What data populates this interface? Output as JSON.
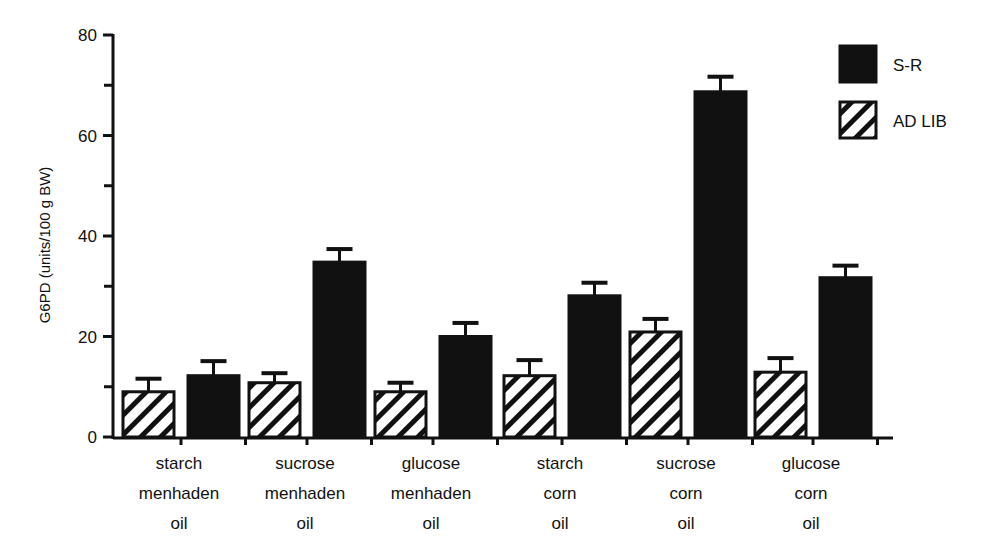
{
  "chart_data": {
    "type": "bar",
    "title": "",
    "xlabel": "",
    "ylabel": "G6PD (units/100 g BW)",
    "ylim": [
      0,
      80
    ],
    "yticks_major": [
      0,
      20,
      40,
      60,
      80
    ],
    "yticks_minor": [
      10,
      30,
      50,
      70
    ],
    "grid": false,
    "legend_position": "upper right",
    "categories": [
      [
        "starch",
        "menhaden",
        "oil"
      ],
      [
        "sucrose",
        "menhaden",
        "oil"
      ],
      [
        "glucose",
        "menhaden",
        "oil"
      ],
      [
        "starch",
        "corn",
        "oil"
      ],
      [
        "sucrose",
        "corn",
        "oil"
      ],
      [
        "glucose",
        "corn",
        "oil"
      ]
    ],
    "series": [
      {
        "name": "AD LIB",
        "pattern": "diagonal-hatch",
        "values": [
          9.0,
          10.8,
          9.0,
          12.2,
          20.9,
          12.9
        ],
        "errors": [
          2.6,
          1.9,
          1.8,
          3.1,
          2.6,
          2.8
        ]
      },
      {
        "name": "S-R",
        "pattern": "solid",
        "values": [
          12.2,
          34.8,
          20.0,
          28.1,
          68.7,
          31.7
        ],
        "errors": [
          2.9,
          2.6,
          2.7,
          2.6,
          3.0,
          2.4
        ]
      }
    ]
  },
  "legend": {
    "items": [
      {
        "label": "S-R",
        "pattern": "solid"
      },
      {
        "label": "AD LIB",
        "pattern": "diagonal-hatch"
      }
    ]
  },
  "colors": {
    "ink": "#111111",
    "background": "#ffffff"
  }
}
